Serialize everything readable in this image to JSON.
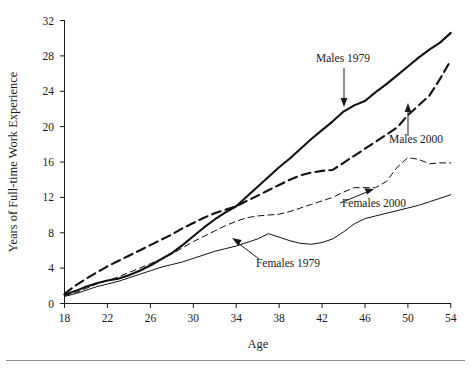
{
  "chart_data": {
    "type": "line",
    "title": "",
    "xlabel": "Age",
    "ylabel": "Years of Full-time Work Experience",
    "xlim": [
      18,
      54
    ],
    "ylim": [
      0,
      32
    ],
    "xticks": [
      18,
      22,
      26,
      30,
      34,
      38,
      42,
      46,
      50,
      54
    ],
    "yticks": [
      0,
      4,
      8,
      12,
      16,
      20,
      24,
      28,
      32
    ],
    "grid": false,
    "legend_position": "inline-annotations",
    "x": [
      18,
      19,
      20,
      21,
      22,
      23,
      24,
      25,
      26,
      27,
      28,
      29,
      30,
      31,
      32,
      33,
      34,
      35,
      36,
      37,
      38,
      39,
      40,
      41,
      42,
      43,
      44,
      45,
      46,
      47,
      48,
      49,
      50,
      51,
      52,
      53,
      54
    ],
    "series": [
      {
        "name": "Males 1979",
        "style": "solid-thick",
        "values": [
          1.0,
          1.4,
          1.9,
          2.3,
          2.6,
          2.8,
          3.2,
          3.7,
          4.3,
          5.0,
          5.7,
          6.6,
          7.6,
          8.6,
          9.5,
          10.3,
          11.0,
          12.1,
          13.2,
          14.3,
          15.4,
          16.4,
          17.5,
          18.6,
          19.6,
          20.6,
          21.7,
          22.4,
          22.9,
          23.9,
          24.8,
          25.8,
          26.8,
          27.8,
          28.7,
          29.5,
          30.6
        ]
      },
      {
        "name": "Males 2000",
        "style": "dashed-thick",
        "values": [
          1.1,
          2.0,
          2.8,
          3.5,
          4.2,
          4.8,
          5.4,
          6.0,
          6.6,
          7.2,
          7.8,
          8.5,
          9.1,
          9.7,
          10.2,
          10.6,
          11.0,
          11.6,
          12.2,
          12.8,
          13.4,
          14.0,
          14.5,
          14.8,
          15.0,
          15.1,
          15.9,
          16.7,
          17.5,
          18.3,
          19.1,
          19.9,
          21.3,
          22.4,
          23.5,
          25.4,
          27.5
        ]
      },
      {
        "name": "Females 2000",
        "style": "dashed-thin",
        "values": [
          0.9,
          1.2,
          1.7,
          2.2,
          2.6,
          3.0,
          3.5,
          4.0,
          4.5,
          5.0,
          5.6,
          6.3,
          7.0,
          7.6,
          8.2,
          8.8,
          9.3,
          9.7,
          9.9,
          10.0,
          10.1,
          10.4,
          10.8,
          11.2,
          11.6,
          12.0,
          12.6,
          13.1,
          13.1,
          13.1,
          13.8,
          15.4,
          16.5,
          16.3,
          15.8,
          15.9,
          15.9
        ]
      },
      {
        "name": "Females 1979",
        "style": "solid-thin",
        "values": [
          0.8,
          1.1,
          1.5,
          1.9,
          2.2,
          2.5,
          2.9,
          3.3,
          3.7,
          4.1,
          4.4,
          4.7,
          5.1,
          5.5,
          5.9,
          6.2,
          6.5,
          6.9,
          7.3,
          7.9,
          7.5,
          7.1,
          6.8,
          6.7,
          6.9,
          7.3,
          8.1,
          9.0,
          9.6,
          9.9,
          10.2,
          10.5,
          10.8,
          11.1,
          11.5,
          11.9,
          12.3
        ]
      }
    ],
    "annotations": [
      {
        "text": "Males 1979",
        "target_series": "Males 1979"
      },
      {
        "text": "Males 2000",
        "target_series": "Males 2000"
      },
      {
        "text": "Females 2000",
        "target_series": "Females 2000"
      },
      {
        "text": "Females 1979",
        "target_series": "Females 1979"
      }
    ]
  },
  "axes": {
    "y_title": "Years of Full-time Work Experience",
    "x_title": "Age",
    "y_tick_labels": [
      "32",
      "28",
      "24",
      "20",
      "16",
      "12",
      "8",
      "4",
      "0"
    ],
    "x_tick_labels": [
      "18",
      "22",
      "26",
      "30",
      "34",
      "38",
      "42",
      "46",
      "50",
      "54"
    ]
  },
  "labels": {
    "males_1979": "Males 1979",
    "males_2000": "Males 2000",
    "females_2000": "Females 2000",
    "females_1979": "Females 1979"
  }
}
